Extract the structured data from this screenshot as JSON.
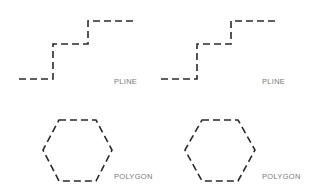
{
  "diagram": {
    "stroke_color": "#2a2a2a",
    "label_color": "#7a7a7a",
    "figures": [
      {
        "id": "pline-left",
        "type": "polyline",
        "label": "PLINE",
        "points": [
          [
            19,
            79
          ],
          [
            53,
            79
          ],
          [
            53,
            44
          ],
          [
            88,
            44
          ],
          [
            88,
            21
          ],
          [
            136,
            21
          ]
        ],
        "label_pos": [
          114,
          77
        ]
      },
      {
        "id": "pline-right",
        "type": "polyline",
        "label": "PLINE",
        "points": [
          [
            161,
            79
          ],
          [
            197,
            79
          ],
          [
            197,
            44
          ],
          [
            231,
            44
          ],
          [
            231,
            21
          ],
          [
            278,
            21
          ]
        ],
        "label_pos": [
          262,
          77
        ]
      },
      {
        "id": "polygon-left",
        "type": "polygon",
        "label": "POLYGON",
        "points": [
          [
            59,
            120
          ],
          [
            96,
            120
          ],
          [
            112,
            150
          ],
          [
            96,
            181
          ],
          [
            59,
            181
          ],
          [
            43,
            150
          ]
        ],
        "label_pos": [
          114,
          172
        ]
      },
      {
        "id": "polygon-right",
        "type": "polygon",
        "label": "POLYGON",
        "points": [
          [
            202,
            120
          ],
          [
            238,
            120
          ],
          [
            255,
            150
          ],
          [
            238,
            181
          ],
          [
            202,
            181
          ],
          [
            185,
            150
          ]
        ],
        "label_pos": [
          262,
          172
        ]
      }
    ]
  }
}
